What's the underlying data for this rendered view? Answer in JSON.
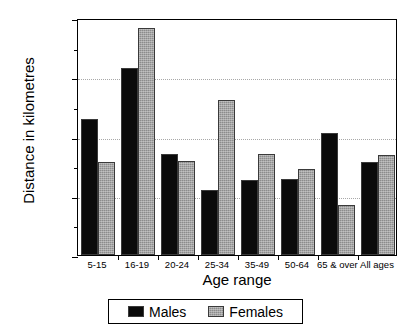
{
  "chart_data": {
    "type": "bar",
    "title": "",
    "xlabel": "Age range",
    "ylabel": "Distance in kilometres",
    "categories": [
      "5-15",
      "16-19",
      "20-24",
      "25-34",
      "35-49",
      "50-64",
      "65 & over",
      "All ages"
    ],
    "series": [
      {
        "name": "Males",
        "color": "#0a0a0a",
        "values": [
          1150,
          1580,
          855,
          550,
          635,
          640,
          1030,
          785
        ]
      },
      {
        "name": "Females",
        "color": "#8c8c8c",
        "values": [
          785,
          1915,
          795,
          1310,
          855,
          730,
          420,
          840
        ]
      }
    ],
    "ylim": [
      0,
      2000
    ],
    "yticks": [
      0,
      500,
      1000,
      1500,
      2000
    ],
    "ytick_labels": [
      "0",
      "500",
      "1000",
      "1500",
      "2000"
    ],
    "yminor_ticks": [
      250,
      750,
      1250,
      1750
    ],
    "grid": true,
    "grid_axis": "y",
    "legend_position": "bottom-center",
    "legend_entries": [
      "Males",
      "Females"
    ]
  }
}
